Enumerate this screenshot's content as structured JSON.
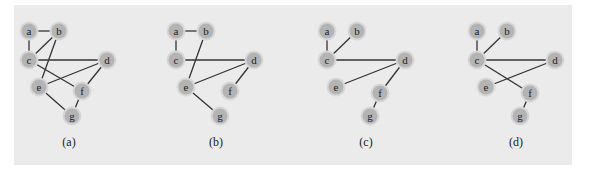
{
  "figure": {
    "background_color": "#ebebeb",
    "node_color": "#b4b4b4",
    "edge_color": "#333333",
    "graphs": [
      {
        "caption": "(a)",
        "caption_pos": [
          69,
          142
        ],
        "nodes": {
          "a": [
            29,
            31
          ],
          "b": [
            59,
            31
          ],
          "c": [
            29,
            60
          ],
          "d": [
            107,
            60
          ],
          "e": [
            39,
            87
          ],
          "f": [
            82,
            91
          ],
          "g": [
            72,
            116
          ]
        },
        "edges": [
          [
            "a",
            "b"
          ],
          [
            "a",
            "c"
          ],
          [
            "b",
            "c"
          ],
          [
            "b",
            "e"
          ],
          [
            "c",
            "d"
          ],
          [
            "c",
            "f"
          ],
          [
            "d",
            "e"
          ],
          [
            "d",
            "f"
          ],
          [
            "e",
            "g"
          ],
          [
            "f",
            "g"
          ]
        ]
      },
      {
        "caption": "(b)",
        "caption_pos": [
          216,
          142
        ],
        "nodes": {
          "a": [
            176,
            31
          ],
          "b": [
            206,
            31
          ],
          "c": [
            176,
            60
          ],
          "d": [
            254,
            60
          ],
          "e": [
            186,
            87
          ],
          "f": [
            230,
            91
          ],
          "g": [
            220,
            116
          ]
        },
        "edges": [
          [
            "a",
            "b"
          ],
          [
            "a",
            "c"
          ],
          [
            "b",
            "e"
          ],
          [
            "c",
            "d"
          ],
          [
            "d",
            "e"
          ],
          [
            "d",
            "f"
          ],
          [
            "e",
            "g"
          ]
        ]
      },
      {
        "caption": "(c)",
        "caption_pos": [
          366,
          142
        ],
        "nodes": {
          "a": [
            327,
            31
          ],
          "b": [
            357,
            31
          ],
          "c": [
            327,
            60
          ],
          "d": [
            405,
            60
          ],
          "e": [
            336,
            87
          ],
          "f": [
            380,
            93
          ],
          "g": [
            370,
            116
          ]
        },
        "edges": [
          [
            "a",
            "c"
          ],
          [
            "b",
            "c"
          ],
          [
            "c",
            "d"
          ],
          [
            "d",
            "e"
          ],
          [
            "d",
            "f"
          ],
          [
            "f",
            "g"
          ]
        ]
      },
      {
        "caption": "(d)",
        "caption_pos": [
          516,
          142
        ],
        "nodes": {
          "a": [
            477,
            31
          ],
          "b": [
            507,
            31
          ],
          "c": [
            477,
            60
          ],
          "d": [
            555,
            60
          ],
          "e": [
            486,
            87
          ],
          "f": [
            530,
            93
          ],
          "g": [
            520,
            116
          ]
        },
        "edges": [
          [
            "a",
            "c"
          ],
          [
            "b",
            "c"
          ],
          [
            "c",
            "d"
          ],
          [
            "c",
            "f"
          ],
          [
            "d",
            "e"
          ],
          [
            "f",
            "g"
          ]
        ]
      }
    ]
  }
}
